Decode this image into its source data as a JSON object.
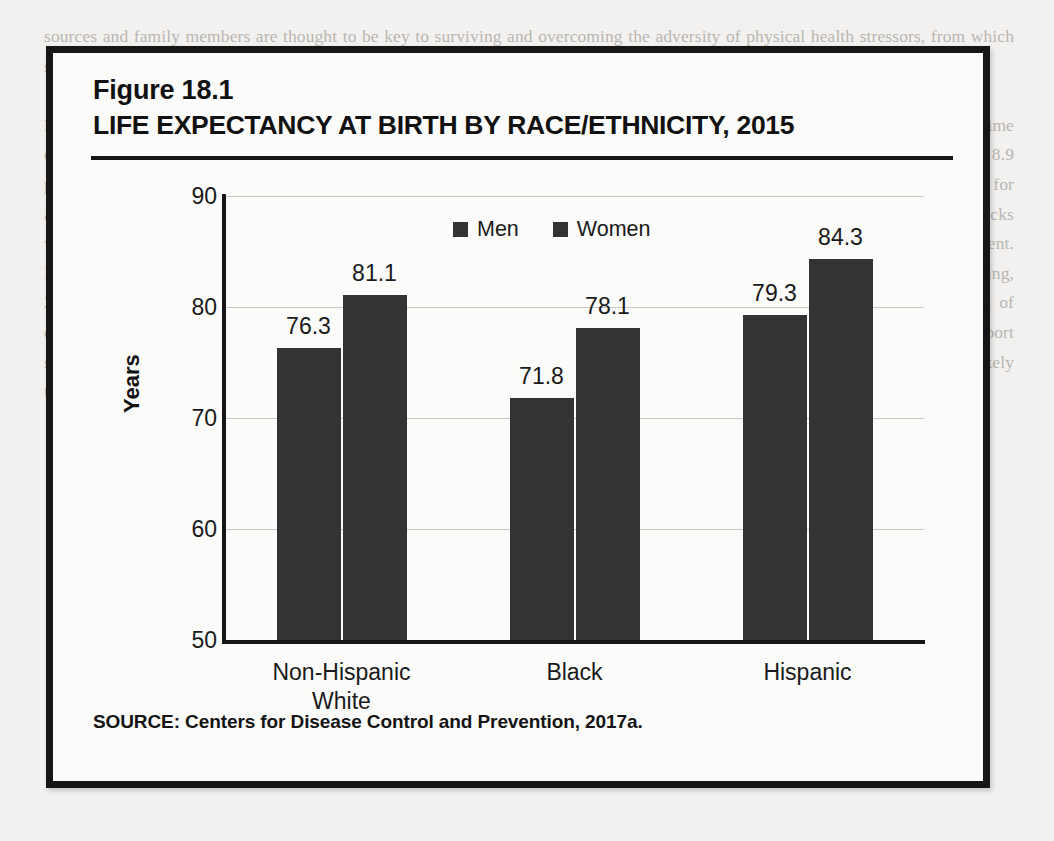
{
  "figure": {
    "number": "Figure 18.1",
    "title": "LIFE EXPECTANCY AT BIRTH BY RACE/ETHNICITY, 2015",
    "source": "SOURCE: Centers for Disease Control and Prevention, 2017a."
  },
  "colors": {
    "bar": "#333333",
    "axis": "#161616",
    "grid": "#c9c7c4",
    "text": "#1a1a1a",
    "figure_background": "#fbfbfa",
    "page_background": "#f2f1ef"
  },
  "chart_data": {
    "type": "bar",
    "title": "LIFE EXPECTANCY AT BIRTH BY RACE/ETHNICITY, 2015",
    "xlabel": "",
    "ylabel": "Years",
    "ylim": [
      50,
      90
    ],
    "yticks": [
      50,
      60,
      70,
      80,
      90
    ],
    "grid": true,
    "legend_position": "top-center",
    "categories": [
      "Non-Hispanic\nWhite",
      "Black",
      "Hispanic"
    ],
    "series": [
      {
        "name": "Men",
        "color": "#333333",
        "values": [
          76.3,
          71.8,
          79.3
        ]
      },
      {
        "name": "Women",
        "color": "#333333",
        "values": [
          81.1,
          78.1,
          84.3
        ]
      }
    ],
    "data_labels": [
      "76.3",
      "81.1",
      "71.8",
      "78.1",
      "79.3",
      "84.3"
    ]
  },
  "page_text": {
    "body": "sources and family members are thought to be key to surviving and overcoming the adversity of physical health stressors, from which some show resilience and recovery.\n\nLevel of depression also varies by race/ethnicity. In a study of depression among U.S. adults, Blacks had the lowest rate of lifetime depression as compared to Whites and Latinos; 10.4 percent of Whites had at least one major depressive episode as compared to 8.9 percent of Blacks. In addition, the rate of depression among Whites was 7.5 percent higher than among Blacks. Furthermore, for adolescents, Whites had a higher rate of depression than Latinos and Blacks. 43.9 percent of the lifetime depressive episodes of Blacks were reported to be chronic as compared to 56.5 percent of Whites. Additionally, there were race differences in access to treatment. More Whites (54.3 percent) with depression received treatment as compared to Blacks (40 percent) (Riolo, Nguyen, Greden, & King, 2005; Williams et al., 2007). Further research is needed to understand the cultural differences related to reporting symptoms of depression and the variation in access to mental health services. It is important to note that Blacks are more likely than others to report somatic symptoms rather than psychological ones, while cultural stigma about mental illness remains prominent. Therefore, it is likely that depression among Blacks is underreported and less likely to be diagnosed."
  }
}
